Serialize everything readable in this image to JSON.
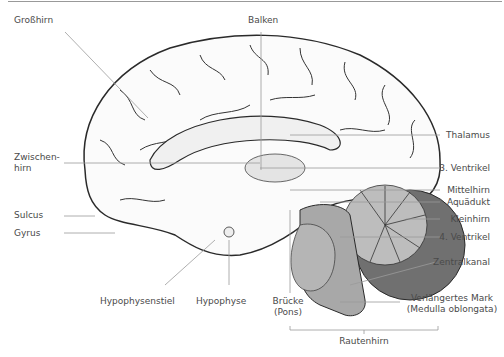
{
  "diagram": {
    "labels": {
      "grosshirn": "Großhirn",
      "balken": "Balken",
      "zwischenhirn_1": "Zwischen-",
      "zwischenhirn_2": "hirn",
      "sulcus": "Sulcus",
      "gyrus": "Gyrus",
      "hypophysenstiel": "Hypophysenstiel",
      "hypophyse": "Hypophyse",
      "bruecke_1": "Brücke",
      "bruecke_2": "(Pons)",
      "thalamus": "Thalamus",
      "ventrikel3": "3. Ventrikel",
      "mittelhirn": "Mittelhirn",
      "aquaedukt": "Aquädukt",
      "kleinhirn": "Kleinhirn",
      "ventrikel4": "4. Ventrikel",
      "zentralkanal": "Zentralkanal",
      "mark_1": "Verlängertes Mark",
      "mark_2": "(Medulla oblongata)",
      "rautenhirn": "Rautenhirn"
    },
    "colors": {
      "outline": "#2a2a2a",
      "leader": "#9a9a9a",
      "brainstem": "#a8a8a8",
      "cerebellum_dark": "#707070",
      "cerebellum_light": "#bdbdbd",
      "cortex_fill": "#fbfbfb"
    }
  }
}
